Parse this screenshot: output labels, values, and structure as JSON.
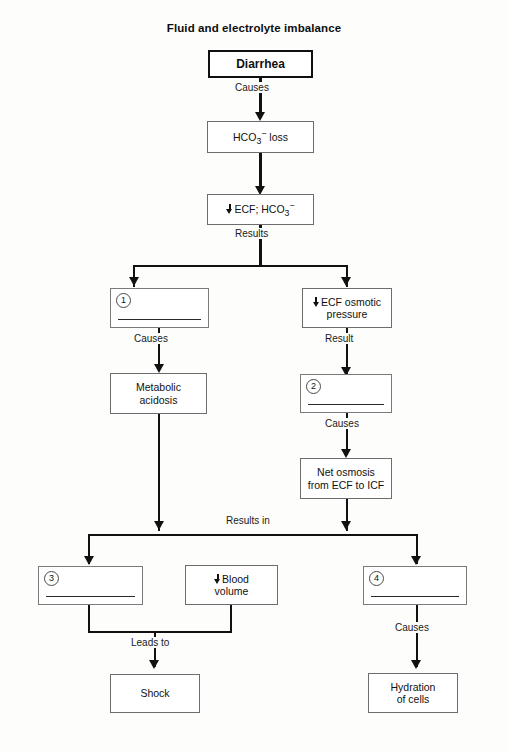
{
  "diagram": {
    "title": "Fluid and electrolyte imbalance",
    "type": "flowchart",
    "nodes": {
      "diarrhea": "Diarrhea",
      "hco3_loss": "HCO3− loss",
      "ecf_hco3": "ECF; HCO3−",
      "blank1": "",
      "ecf_osmotic": "ECF osmotic\npressure",
      "metabolic_acidosis": "Metabolic\nacidosis",
      "blank2": "",
      "net_osmosis": "Net osmosis\nfrom ECF to ICF",
      "blank3": "",
      "blood_volume": "Blood\nvolume",
      "blank4": "",
      "shock": "Shock",
      "hydration": "Hydration\nof cells"
    },
    "numbers": {
      "one": "1",
      "two": "2",
      "three": "3",
      "four": "4"
    },
    "edge_labels": {
      "causes_1": "Causes",
      "results": "Results",
      "causes_2": "Causes",
      "result": "Result",
      "causes_3": "Causes",
      "results_in": "Results in",
      "leads_to": "Leads to",
      "causes_4": "Causes"
    },
    "colors": {
      "line": "#111111",
      "box_border": "#6d6d6d",
      "emphasis_border": "#101010",
      "background": "#fdfdfc",
      "text": "#111111"
    }
  }
}
